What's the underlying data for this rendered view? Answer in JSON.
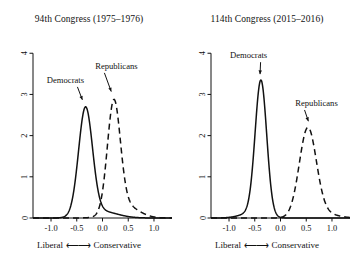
{
  "figure": {
    "background_color": "#ffffff",
    "foreground_color": "#111111",
    "panel_count": 2
  },
  "chart_data": [
    {
      "type": "line",
      "title": "94th Congress (1975–1976)",
      "xlabel": "Liberal ⟵⟶ Conservative",
      "ylabel": "",
      "xlim": [
        -1.35,
        1.35
      ],
      "ylim": [
        0,
        4.2
      ],
      "xticks": [
        -1.0,
        -0.5,
        0.0,
        0.5,
        1.0
      ],
      "xticklabels": [
        "-1.0",
        "-0.5",
        "0.0",
        "0.5",
        "1.0"
      ],
      "yticks": [
        0,
        1,
        2,
        3,
        4
      ],
      "yticklabels": [
        "0",
        "1",
        "2",
        "3",
        "4"
      ],
      "grid": false,
      "legend": "annotated",
      "annotations": [
        {
          "text": "Democrats",
          "label_x": -0.72,
          "label_y": 3.28,
          "point_x": -0.37,
          "point_y": 2.8
        },
        {
          "text": "Republicans",
          "label_x": 0.27,
          "label_y": 3.62,
          "point_x": 0.19,
          "point_y": 3.0
        }
      ],
      "series": [
        {
          "name": "Democrats",
          "style": "solid",
          "color": "#111111",
          "distribution": "normal-mixture",
          "peak_x": -0.33,
          "peak_y": 2.7,
          "components": [
            {
              "mean": -0.33,
              "sd": 0.135,
              "weight": 0.88
            },
            {
              "mean": -0.02,
              "sd": 0.3,
              "weight": 0.12
            }
          ]
        },
        {
          "name": "Republicans",
          "style": "dashed",
          "color": "#111111",
          "distribution": "normal-mixture",
          "peak_x": 0.21,
          "peak_y": 2.88,
          "components": [
            {
              "mean": 0.22,
              "sd": 0.125,
              "weight": 0.8
            },
            {
              "mean": 0.42,
              "sd": 0.26,
              "weight": 0.2
            }
          ]
        }
      ]
    },
    {
      "type": "line",
      "title": "114th Congress (2015–2016)",
      "xlabel": "Liberal ⟵⟶ Conservative",
      "ylabel": "",
      "xlim": [
        -1.35,
        1.35
      ],
      "ylim": [
        0,
        4.2
      ],
      "xticks": [
        -1.0,
        -0.5,
        0.0,
        0.5,
        1.0
      ],
      "xticklabels": [
        "-1.0",
        "-0.5",
        "0.0",
        "0.5",
        "1.0"
      ],
      "yticks": [
        0,
        1,
        2,
        3,
        4
      ],
      "yticklabels": [
        "0",
        "1",
        "2",
        "3",
        "4"
      ],
      "grid": false,
      "legend": "annotated",
      "annotations": [
        {
          "text": "Democrats",
          "label_x": -0.62,
          "label_y": 3.88,
          "point_x": -0.4,
          "point_y": 3.42
        },
        {
          "text": "Republicans",
          "label_x": 0.7,
          "label_y": 2.72,
          "point_x": 0.56,
          "point_y": 2.28
        }
      ],
      "series": [
        {
          "name": "Democrats",
          "style": "solid",
          "color": "#111111",
          "distribution": "normal-mixture",
          "peak_x": -0.38,
          "peak_y": 3.35,
          "components": [
            {
              "mean": -0.38,
              "sd": 0.112,
              "weight": 0.93
            },
            {
              "mean": -0.55,
              "sd": 0.22,
              "weight": 0.07
            }
          ]
        },
        {
          "name": "Republicans",
          "style": "dashed",
          "color": "#111111",
          "distribution": "normal-mixture",
          "peak_x": 0.53,
          "peak_y": 2.2,
          "components": [
            {
              "mean": 0.53,
              "sd": 0.165,
              "weight": 0.92
            },
            {
              "mean": 0.8,
              "sd": 0.26,
              "weight": 0.08
            }
          ]
        }
      ]
    }
  ],
  "axis_caption": {
    "left_word": "Liberal",
    "arrow": "⟵⟶",
    "right_word": "Conservative"
  }
}
